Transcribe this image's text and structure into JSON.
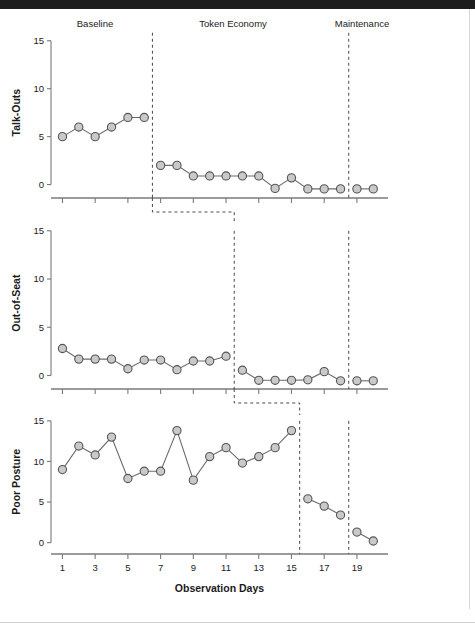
{
  "figure": {
    "x_axis_title": "Observation Days",
    "x_tick_labels": [
      "1",
      "3",
      "5",
      "7",
      "9",
      "11",
      "13",
      "15",
      "17",
      "19"
    ],
    "x_tick_values": [
      1,
      3,
      5,
      7,
      9,
      11,
      13,
      15,
      17,
      19
    ],
    "y_tick_labels": [
      "0",
      "5",
      "10",
      "15"
    ],
    "phase_labels": [
      "Baseline",
      "Token Economy",
      "Maintenance"
    ],
    "colors": {
      "marker_fill": "#c9c9c9",
      "marker_stroke": "#555555",
      "line": "#6b6b6b",
      "axis": "#7a7a7a",
      "phase_line": "#4a4a4a",
      "text": "#1a1a1a"
    }
  },
  "chart_data": {
    "type": "line",
    "title": "",
    "subtitle": "",
    "xlabel": "Observation Days",
    "xlim": [
      0.3,
      20.9
    ],
    "ylim": [
      -1.4,
      15.6
    ],
    "grid": false,
    "legend": null,
    "x_ticks": [
      1,
      3,
      5,
      7,
      9,
      11,
      13,
      15,
      17,
      19
    ],
    "y_ticks": [
      0,
      5,
      10,
      15
    ],
    "phases": [
      "Baseline",
      "Token Economy",
      "Maintenance"
    ],
    "panels": [
      {
        "name": "talk-outs",
        "ylabel": "Talk-Outs",
        "ylim": [
          -1.4,
          15.6
        ],
        "phase_change_days": [
          6.5,
          18.5
        ],
        "segments": [
          {
            "phase": "Baseline",
            "x": [
              1,
              2,
              3,
              4,
              5,
              6
            ],
            "y": [
              5.0,
              6.0,
              5.0,
              6.0,
              7.0,
              7.0
            ]
          },
          {
            "phase": "Token Economy",
            "x": [
              7,
              8,
              9,
              10,
              11,
              12,
              13,
              14,
              15,
              16,
              17,
              18
            ],
            "y": [
              2.0,
              2.0,
              0.9,
              0.9,
              0.9,
              0.9,
              0.9,
              -0.4,
              0.7,
              -0.45,
              -0.45,
              -0.45
            ]
          },
          {
            "phase": "Maintenance",
            "x": [
              19,
              20
            ],
            "y": [
              -0.45,
              -0.45
            ]
          }
        ]
      },
      {
        "name": "out-of-seat",
        "ylabel": "Out-of-Seat",
        "ylim": [
          -1.4,
          15.6
        ],
        "phase_change_days": [
          11.5,
          18.5
        ],
        "segments": [
          {
            "phase": "Baseline",
            "x": [
              1,
              2,
              3,
              4,
              5,
              6,
              7,
              8,
              9,
              10,
              11
            ],
            "y": [
              2.8,
              1.7,
              1.7,
              1.7,
              0.7,
              1.6,
              1.6,
              0.6,
              1.5,
              1.5,
              2.0
            ]
          },
          {
            "phase": "Token Economy",
            "x": [
              12,
              13,
              14,
              15,
              16,
              17,
              18
            ],
            "y": [
              0.55,
              -0.5,
              -0.5,
              -0.5,
              -0.45,
              0.4,
              -0.55
            ]
          },
          {
            "phase": "Maintenance",
            "x": [
              19,
              20
            ],
            "y": [
              -0.55,
              -0.55
            ]
          }
        ]
      },
      {
        "name": "poor-posture",
        "ylabel": "Poor Posture",
        "ylim": [
          -1.4,
          15.6
        ],
        "phase_change_days": [
          15.5,
          18.5
        ],
        "segments": [
          {
            "phase": "Baseline",
            "x": [
              1,
              2,
              3,
              4,
              5,
              6,
              7,
              8,
              9,
              10,
              11,
              12,
              13,
              14,
              15
            ],
            "y": [
              9.0,
              11.9,
              10.8,
              13.0,
              7.9,
              8.8,
              8.8,
              13.8,
              7.7,
              10.6,
              11.7,
              9.8,
              10.6,
              11.7,
              13.8
            ]
          },
          {
            "phase": "Token Economy",
            "x": [
              16,
              17,
              18
            ],
            "y": [
              5.4,
              4.5,
              3.4
            ]
          },
          {
            "phase": "Maintenance",
            "x": [
              19,
              20
            ],
            "y": [
              1.3,
              0.2
            ]
          }
        ]
      }
    ]
  }
}
